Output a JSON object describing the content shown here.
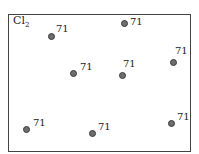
{
  "diagram": {
    "title_main": "Cl",
    "title_sub": "2",
    "points": [
      {
        "x": 51,
        "y": 36,
        "label": "71",
        "lx": 56,
        "ly": 24
      },
      {
        "x": 124,
        "y": 23,
        "label": "71",
        "lx": 130,
        "ly": 17
      },
      {
        "x": 73,
        "y": 73,
        "label": "71",
        "lx": 80,
        "ly": 62
      },
      {
        "x": 122,
        "y": 75,
        "label": "71",
        "lx": 123,
        "ly": 59
      },
      {
        "x": 173,
        "y": 62,
        "label": "71",
        "lx": 175,
        "ly": 46
      },
      {
        "x": 26,
        "y": 129,
        "label": "71",
        "lx": 33,
        "ly": 118
      },
      {
        "x": 92,
        "y": 133,
        "label": "71",
        "lx": 98,
        "ly": 122
      },
      {
        "x": 171,
        "y": 123,
        "label": "71",
        "lx": 177,
        "ly": 112
      }
    ]
  }
}
